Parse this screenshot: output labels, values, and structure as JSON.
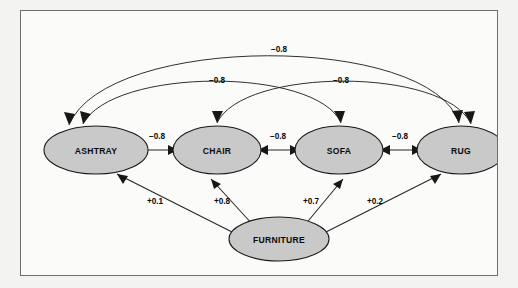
{
  "diagram": {
    "type": "semantic-network-spreading-activation",
    "frame": {
      "border_color": "#6f6f72",
      "background_color": "#fbfbfa",
      "outer_background_color": "#f3f3f1"
    },
    "style": {
      "node_fill": "#c9c9c9",
      "node_stroke": "#1a1a1a",
      "edge_color": "#252525",
      "label_color": "#0a0a0a"
    },
    "nodes": [
      {
        "id": "ashtray",
        "label": "ASHTRAY",
        "cx": 75,
        "cy": 143,
        "rx": 52,
        "ry": 24
      },
      {
        "id": "chair",
        "label": "CHAIR",
        "cx": 196,
        "cy": 143,
        "rx": 44,
        "ry": 24
      },
      {
        "id": "sofa",
        "label": "SOFA",
        "cx": 318,
        "cy": 143,
        "rx": 44,
        "ry": 24
      },
      {
        "id": "rug",
        "label": "RUG",
        "cx": 440,
        "cy": 143,
        "rx": 44,
        "ry": 24
      },
      {
        "id": "furniture",
        "label": "FURNITURE",
        "cx": 258,
        "cy": 228,
        "rx": 50,
        "ry": 22
      }
    ],
    "edges": [
      {
        "id": "ashtray-rug",
        "from": "ashtray",
        "to": "rug",
        "weight": "−0.8",
        "kind": "arc",
        "direction": "both",
        "label_x": 258,
        "label_y": 38
      },
      {
        "id": "ashtray-sofa",
        "from": "ashtray",
        "to": "sofa",
        "weight": "−0.8",
        "kind": "arc",
        "direction": "both",
        "label_x": 196,
        "label_y": 69
      },
      {
        "id": "chair-rug",
        "from": "chair",
        "to": "rug",
        "weight": "−0.8",
        "kind": "arc",
        "direction": "both",
        "label_x": 320,
        "label_y": 69
      },
      {
        "id": "ashtray-chair",
        "from": "ashtray",
        "to": "chair",
        "weight": "−0.8",
        "kind": "straight",
        "direction": "both",
        "label_x": 136,
        "label_y": 127
      },
      {
        "id": "chair-sofa",
        "from": "chair",
        "to": "sofa",
        "weight": "−0.8",
        "kind": "straight",
        "direction": "both",
        "label_x": 257,
        "label_y": 127
      },
      {
        "id": "sofa-rug",
        "from": "sofa",
        "to": "rug",
        "weight": "−0.8",
        "kind": "straight",
        "direction": "both",
        "label_x": 379,
        "label_y": 127
      },
      {
        "id": "furniture-ashtray",
        "from": "furniture",
        "to": "ashtray",
        "weight": "+0.1",
        "kind": "straight",
        "direction": "to",
        "label_x": 134,
        "label_y": 190
      },
      {
        "id": "furniture-chair",
        "from": "furniture",
        "to": "chair",
        "weight": "+0.8",
        "kind": "straight",
        "direction": "to",
        "label_x": 201,
        "label_y": 190
      },
      {
        "id": "furniture-sofa",
        "from": "furniture",
        "to": "sofa",
        "weight": "+0.7",
        "kind": "straight",
        "direction": "to",
        "label_x": 290,
        "label_y": 190
      },
      {
        "id": "furniture-rug",
        "from": "furniture",
        "to": "rug",
        "weight": "+0.2",
        "kind": "straight",
        "direction": "to",
        "label_x": 354,
        "label_y": 190
      }
    ]
  }
}
